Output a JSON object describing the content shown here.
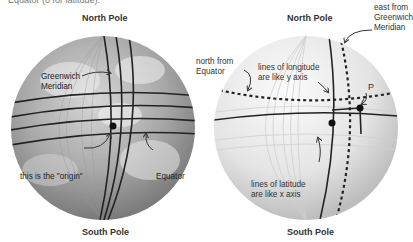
{
  "caption_fragment": "Equator (0 for latitude).",
  "left_globe": {
    "north_label": "North Pole",
    "south_label": "South Pole",
    "greenwich_line1": "Greenwich",
    "greenwich_line2": "Meridian",
    "origin_label": "this is the \"origin\"",
    "equator_label": "Equator"
  },
  "right_globe": {
    "north_label": "North Pole",
    "south_label": "South Pole",
    "east_line1": "east from",
    "east_line2": "Greenwich",
    "east_line3": "Meridian",
    "north_from_line1": "north from",
    "north_from_line2": "Equator",
    "longitude_line1": "lines of longitude",
    "longitude_line2": "are like y axis",
    "latitude_line1": "lines of latitude",
    "latitude_line2": "are like x axis",
    "point_label": "P"
  }
}
